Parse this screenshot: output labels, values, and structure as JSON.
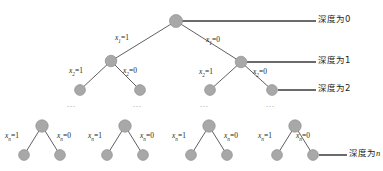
{
  "diagram": {
    "colors": {
      "node_fill": "#a8a8a8",
      "node_stroke": "#8f8f8f",
      "edge": "#4d4d4d",
      "leader_line": "#3a3a3a",
      "text": "#231f20",
      "dots": "#8a8a8a",
      "background": "#ffffff"
    },
    "edge_labels": {
      "x1_true": {
        "var": "x",
        "sub": "1",
        "eq": "=1"
      },
      "x1_false": {
        "var": "x",
        "sub": "1",
        "eq": "=0"
      },
      "x2_true": {
        "var": "x",
        "sub": "2",
        "eq": "=1"
      },
      "x2_false": {
        "var": "x",
        "sub": "2",
        "eq": "=0"
      },
      "xn_true": {
        "var": "x",
        "sub": "n",
        "eq": "=1"
      },
      "xn_false": {
        "var": "x",
        "sub": "n",
        "eq": "=0"
      }
    },
    "depth_labels": [
      {
        "prefix": "深度为",
        "value": "0"
      },
      {
        "prefix": "深度为",
        "value": "1"
      },
      {
        "prefix": "深度为",
        "value": "2"
      },
      {
        "prefix": "深度为",
        "value": "n"
      }
    ],
    "ellipsis": "...",
    "nodes": {
      "root": {
        "cx": 176,
        "cy": 21,
        "r": 6.5
      },
      "level1": [
        {
          "cx": 111,
          "cy": 61,
          "r": 5.8
        },
        {
          "cx": 241,
          "cy": 62,
          "r": 5.8
        }
      ],
      "level2": [
        {
          "cx": 80,
          "cy": 90,
          "r": 5.4
        },
        {
          "cx": 140,
          "cy": 90,
          "r": 5.4
        },
        {
          "cx": 210,
          "cy": 90,
          "r": 5.4
        },
        {
          "cx": 272,
          "cy": 90,
          "r": 5.4
        }
      ],
      "bottom_subtrees": [
        {
          "apex_x": 42,
          "apex_y": 126,
          "left_x": 24,
          "right_x": 60,
          "leaf_y": 155
        },
        {
          "apex_x": 125,
          "apex_y": 126,
          "left_x": 107,
          "right_x": 143,
          "leaf_y": 155
        },
        {
          "apex_x": 209,
          "apex_y": 126,
          "left_x": 191,
          "right_x": 227,
          "leaf_y": 155
        },
        {
          "apex_x": 295,
          "apex_y": 126,
          "left_x": 277,
          "right_x": 313,
          "leaf_y": 155
        }
      ]
    },
    "leader_lines": [
      {
        "from_x": 182,
        "y": 21,
        "to_x": 316
      },
      {
        "from_x": 247,
        "y": 62,
        "to_x": 316
      },
      {
        "from_x": 278,
        "y": 90,
        "to_x": 316
      },
      {
        "from_x": 319,
        "y": 155,
        "to_x": 347
      }
    ],
    "ellipsis_positions": [
      {
        "x": 67,
        "y": 104
      },
      {
        "x": 133,
        "y": 104
      },
      {
        "x": 200,
        "y": 104
      },
      {
        "x": 266,
        "y": 104
      }
    ]
  }
}
